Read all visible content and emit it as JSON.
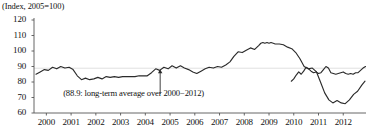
{
  "chart_data": {
    "type": "line",
    "title": "(Index, 2005=100)",
    "xlabel": "",
    "ylabel": "",
    "ylim": [
      60,
      120
    ],
    "xlim": [
      1999.5,
      2012.92
    ],
    "yticks": [
      60,
      70,
      80,
      90,
      100,
      110,
      120
    ],
    "xticks": [
      2000,
      2001,
      2002,
      2003,
      2004,
      2005,
      2006,
      2007,
      2008,
      2009,
      2010,
      2011,
      2012
    ],
    "grid": "single horizontal reference line at 88.9",
    "legend": "none",
    "reference_line": {
      "value": 88.9,
      "label": "long-term average over 2000-2012"
    },
    "annotations": [
      {
        "text": "(88.9: long-term average over 2000−2012)",
        "x": 2004.6,
        "y": 73.5,
        "arrow_to": {
          "x": 2004.6,
          "y": 88.9
        }
      }
    ],
    "series": [
      {
        "name": "index",
        "x": [
          1999.58,
          1999.75,
          1999.92,
          2000.08,
          2000.25,
          2000.42,
          2000.58,
          2000.75,
          2000.92,
          2001.08,
          2001.25,
          2001.42,
          2001.58,
          2001.75,
          2001.92,
          2002.08,
          2002.25,
          2002.42,
          2002.58,
          2002.75,
          2002.92,
          2003.08,
          2003.25,
          2003.42,
          2003.58,
          2003.75,
          2003.92,
          2004.08,
          2004.25,
          2004.42,
          2004.58,
          2004.75,
          2004.92,
          2005.08,
          2005.25,
          2005.42,
          2005.58,
          2005.75,
          2005.92,
          2006.08,
          2006.25,
          2006.42,
          2006.58,
          2006.75,
          2006.92,
          2007.08,
          2007.25,
          2007.42,
          2007.58,
          2007.75,
          2007.92,
          2008.08,
          2008.25,
          2008.42,
          2008.58,
          2008.67,
          2008.75,
          2008.83,
          2008.92,
          2009.0,
          2009.08,
          2009.17,
          2009.25,
          2009.42,
          2009.58,
          2009.75,
          2009.92,
          2010.08,
          2010.25,
          2010.42,
          2010.58,
          2010.75,
          2010.92,
          2011.08,
          2011.25,
          2011.42,
          2011.58,
          2011.75,
          2011.92,
          2012.08,
          2012.25,
          2012.42,
          2012.58,
          2012.75,
          2012.88
        ],
        "y": [
          85.0,
          86.5,
          88.0,
          87.5,
          89.5,
          88.5,
          90.0,
          89.0,
          89.5,
          88.0,
          84.0,
          81.5,
          82.5,
          81.5,
          82.0,
          83.0,
          82.0,
          83.5,
          83.0,
          83.5,
          83.0,
          83.5,
          83.5,
          83.5,
          83.5,
          84.0,
          84.0,
          84.0,
          86.0,
          88.5,
          87.5,
          89.5,
          88.5,
          90.5,
          89.0,
          90.5,
          89.0,
          88.0,
          86.5,
          85.5,
          87.0,
          88.5,
          89.5,
          89.0,
          90.0,
          89.5,
          91.0,
          93.0,
          96.5,
          99.5,
          99.0,
          100.5,
          102.0,
          101.0,
          103.5,
          105.0,
          105.5,
          105.0,
          105.5,
          105.0,
          105.5,
          105.0,
          104.5,
          104.5,
          104.0,
          102.5,
          101.5,
          99.0,
          95.0,
          90.0,
          88.5,
          89.0,
          86.5,
          80.0,
          73.0,
          68.5,
          66.5,
          68.0,
          66.5,
          66.0,
          68.5,
          72.0,
          74.0,
          78.0,
          80.5
        ]
      },
      {
        "name": "index-tail",
        "x": [
          2009.9,
          2010.0,
          2010.1,
          2010.2,
          2010.3,
          2010.4,
          2010.5,
          2010.6,
          2010.7,
          2010.8,
          2010.9,
          2011.0,
          2011.1,
          2011.2,
          2011.3,
          2011.4,
          2011.5,
          2011.6,
          2011.7,
          2011.8,
          2011.9,
          2012.0,
          2012.1,
          2012.2,
          2012.3,
          2012.4,
          2012.5,
          2012.6,
          2012.7,
          2012.8,
          2012.9
        ],
        "y": [
          80.5,
          82.0,
          84.5,
          86.5,
          85.0,
          87.0,
          89.5,
          88.5,
          87.0,
          86.0,
          86.5,
          85.5,
          86.0,
          88.0,
          90.0,
          89.0,
          86.0,
          85.5,
          85.0,
          85.5,
          86.0,
          86.5,
          85.5,
          85.0,
          85.5,
          85.0,
          86.0,
          86.0,
          87.5,
          89.0,
          90.0
        ]
      }
    ]
  },
  "labels": {
    "axis_title": "(Index, 2005=100)",
    "annotation": "(88.9: long-term average over 2000−2012)",
    "y": [
      "120",
      "110",
      "100",
      "90",
      "80",
      "70",
      "60"
    ],
    "x": [
      "2000",
      "2001",
      "2002",
      "2003",
      "2004",
      "2005",
      "2006",
      "2007",
      "2008",
      "2009",
      "2010",
      "2011",
      "2012"
    ]
  },
  "colors": {
    "line": "#2b2b2b",
    "axis": "#555555",
    "grid": "#d8d8d8",
    "background": "#ffffff",
    "text": "#111111"
  }
}
